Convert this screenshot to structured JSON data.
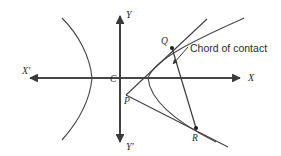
{
  "figure": {
    "name": "chord-of-contact-hyperbola-diagram",
    "background_color": "#ffffff",
    "ink_color": "#3a3a3a"
  },
  "axes": {
    "x_positive_label": "X",
    "x_negative_label": "X'",
    "y_positive_label": "Y",
    "y_negative_label": "Y'",
    "origin_label": "C"
  },
  "points": {
    "origin": {
      "label": "C",
      "x": 120,
      "y": 78
    },
    "external": {
      "label": "P",
      "x": 126,
      "y": 95
    },
    "tangency_upper": {
      "label": "Q",
      "x": 172,
      "y": 48
    },
    "tangency_lower": {
      "label": "R",
      "x": 196,
      "y": 128
    }
  },
  "annotations": [
    {
      "text": "Chord of contact",
      "x": 190,
      "y": 52
    }
  ],
  "curve": {
    "type": "hyperbola",
    "center_x": 120,
    "center_y": 78,
    "vertex_right_x": 148,
    "vertex_left_x": 92,
    "semi_transverse_axis": 28,
    "semi_conjugate_axis": 34
  }
}
